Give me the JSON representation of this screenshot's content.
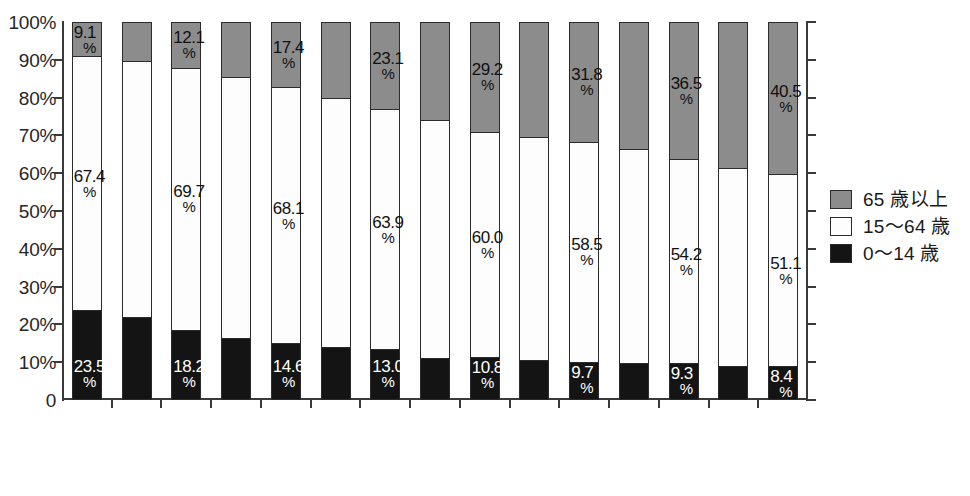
{
  "chart_data": {
    "type": "bar",
    "subtype": "stacked-100-percent",
    "title": "",
    "xlabel": "",
    "ylabel": "",
    "ylim": [
      0,
      100
    ],
    "grid": false,
    "legend_position": "right",
    "year_suffix": "年",
    "percent_suffix": "%",
    "categories": [
      "1980年",
      "1985年",
      "1990年",
      "1995年",
      "2000年",
      "2005年",
      "2010年",
      "2015年",
      "2020年",
      "2025年",
      "2030年",
      "2035年",
      "2040年",
      "2045年",
      "2050年"
    ],
    "ytick_labels": [
      "0",
      "10%",
      "20%",
      "30%",
      "40%",
      "50%",
      "60%",
      "70%",
      "80%",
      "90%",
      "100%"
    ],
    "ytick_values": [
      0,
      10,
      20,
      30,
      40,
      50,
      60,
      70,
      80,
      90,
      100
    ],
    "series": [
      {
        "name": "65 歳以上",
        "color": "#8c8c8c",
        "label_color": "#111111",
        "values": [
          9.1,
          10.3,
          12.1,
          14.6,
          17.4,
          20.2,
          23.1,
          26.0,
          29.2,
          30.5,
          31.8,
          33.7,
          36.5,
          38.9,
          40.5
        ],
        "labels": [
          "9.1",
          null,
          "12.1",
          null,
          "17.4",
          null,
          "23.1",
          null,
          "29.2",
          null,
          "31.8",
          null,
          "36.5",
          null,
          "40.5"
        ]
      },
      {
        "name": "15～64 歳",
        "color": "#fdfdfd",
        "label_color": "#111111",
        "values": [
          67.4,
          68.2,
          69.7,
          69.5,
          68.1,
          66.1,
          63.9,
          63.3,
          60.0,
          59.5,
          58.5,
          57.0,
          54.2,
          52.5,
          51.1
        ],
        "labels": [
          "67.4",
          null,
          "69.7",
          null,
          "68.1",
          null,
          "63.9",
          null,
          "60.0",
          null,
          "58.5",
          null,
          "54.2",
          null,
          "51.1"
        ]
      },
      {
        "name": "0～14 歳",
        "color": "#141414",
        "label_color": "#ffffff",
        "values": [
          23.5,
          21.5,
          18.2,
          15.9,
          14.6,
          13.7,
          13.0,
          10.7,
          10.8,
          10.0,
          9.7,
          9.3,
          9.3,
          8.6,
          8.4
        ],
        "labels": [
          "23.5",
          null,
          "18.2",
          null,
          "14.6",
          null,
          "13.0",
          null,
          "10.8",
          null,
          "9.7",
          null,
          "9.3",
          null,
          "8.4"
        ]
      }
    ]
  },
  "legend": {
    "items": [
      {
        "label": "65 歳以上",
        "swatch": "old"
      },
      {
        "label": "15～64 歳",
        "swatch": "mid"
      },
      {
        "label": "0～14 歳",
        "swatch": "young"
      }
    ]
  }
}
